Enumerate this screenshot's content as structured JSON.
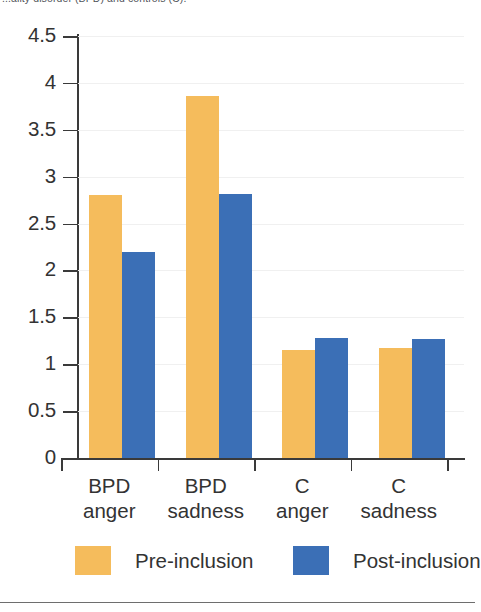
{
  "caption": {
    "text": "...ality disorder (BPD) and controls (C)."
  },
  "chart_data": {
    "type": "bar",
    "title": "",
    "subtitle": "",
    "xlabel": "",
    "ylabel": "",
    "categories": [
      "BPD anger",
      "BPD sadness",
      "C anger",
      "C sadness"
    ],
    "category_lines": [
      [
        "BPD",
        "anger"
      ],
      [
        "BPD",
        "sadness"
      ],
      [
        "C",
        "anger"
      ],
      [
        "C",
        "sadness"
      ]
    ],
    "series": [
      {
        "name": "Pre-inclusion",
        "color": "#F5BC5C",
        "values": [
          2.8,
          3.86,
          1.15,
          1.17
        ]
      },
      {
        "name": "Post-inclusion",
        "color": "#3B6FB6",
        "values": [
          2.2,
          2.82,
          1.28,
          1.27
        ]
      }
    ],
    "ylim": [
      0,
      4.5
    ],
    "ytick_values": [
      4.5,
      4,
      3.5,
      3,
      2.5,
      2,
      1.5,
      1,
      0.5,
      0
    ],
    "ytick_labels": [
      "4.5",
      "4",
      "3.5",
      "3",
      "2.5",
      "2",
      "1.5",
      "1",
      "0.5",
      "0"
    ],
    "grid": "horizontal-faint",
    "legend_position": "bottom",
    "legend_entries": [
      {
        "label": "Pre-inclusion",
        "color": "#F5BC5C"
      },
      {
        "label": "Post-inclusion",
        "color": "#3B6FB6"
      }
    ]
  },
  "colors": {
    "pre": "#F5BC5C",
    "post": "#3B6FB6",
    "axis": "#3a3a3a",
    "text": "#333333"
  }
}
